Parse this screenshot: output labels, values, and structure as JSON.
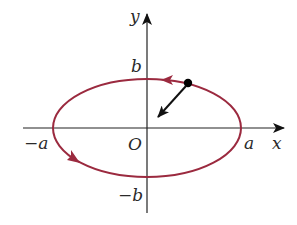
{
  "diagram": {
    "axes": {
      "x_label": "x",
      "y_label": "y",
      "origin_label": "O"
    },
    "tick_labels": {
      "pos_a": "a",
      "neg_a": "−a",
      "pos_b": "b",
      "neg_b": "−b"
    },
    "ellipse": {
      "orientation": "counterclockwise",
      "color": "#9b2a3f"
    },
    "particle": {
      "color": "#000000",
      "vector_direction": "toward-origin"
    }
  }
}
